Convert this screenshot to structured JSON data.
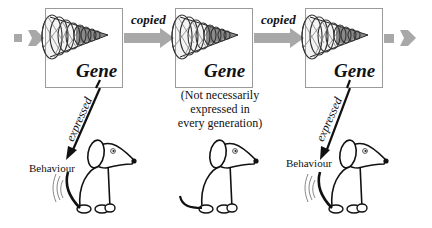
{
  "diagram": {
    "colors": {
      "arrow": "#a8a8a8",
      "box_border": "#9a9a9a",
      "ink": "#111111"
    },
    "genes": [
      {
        "label": "Gene",
        "expressed": true,
        "expressed_label": "expressed",
        "behaviour_label": "Behaviour"
      },
      {
        "label": "Gene",
        "expressed": false,
        "note": [
          "(Not necessarily",
          "expressed in",
          "every generation)"
        ]
      },
      {
        "label": "Gene",
        "expressed": true,
        "expressed_label": "expressed",
        "behaviour_label": "Behaviour"
      }
    ],
    "arrows": [
      {
        "label": "copied"
      },
      {
        "label": "copied"
      }
    ]
  }
}
